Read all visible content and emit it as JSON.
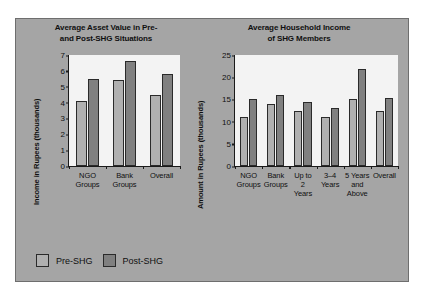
{
  "legend": {
    "items": [
      {
        "label": "Pre-SHG",
        "key": "pre",
        "color": "#b0b0b0"
      },
      {
        "label": "Post-SHG",
        "key": "post",
        "color": "#808080"
      }
    ]
  },
  "chart_data": [
    {
      "id": "asset-value",
      "type": "bar",
      "title": "Average Asset Value in Pre- and Post-SHG Situations",
      "title_line1": "Average Asset Value in Pre-",
      "title_line2": "and Post-SHG Situations",
      "xlabel": "",
      "ylabel": "Income in Rupees (thousands)",
      "ylim": [
        0,
        7
      ],
      "yticks": [
        0,
        1,
        2,
        3,
        4,
        5,
        6,
        7
      ],
      "grid": false,
      "legend_position": "bottom-left",
      "categories": [
        "NGO Groups",
        "Bank Groups",
        "Overall"
      ],
      "category_lines": [
        [
          "NGO",
          "Groups"
        ],
        [
          "Bank",
          "Groups"
        ],
        [
          "Overall"
        ]
      ],
      "series": [
        {
          "name": "Pre-SHG",
          "values": [
            4.1,
            5.4,
            4.5
          ]
        },
        {
          "name": "Post-SHG",
          "values": [
            5.5,
            6.65,
            5.8
          ]
        }
      ]
    },
    {
      "id": "household-income",
      "type": "bar",
      "title": "Average Household Income of SHG Members",
      "title_line1": "Average Household Income",
      "title_line2": "of SHG Members",
      "xlabel": "",
      "ylabel": "Amount in Rupees (thousands)",
      "ylim": [
        0,
        25
      ],
      "yticks": [
        0,
        5,
        10,
        15,
        20,
        25
      ],
      "grid": false,
      "legend_position": "bottom-left",
      "categories": [
        "NGO Groups",
        "Bank Groups",
        "Up to 2 Years",
        "3–4 Years",
        "5 Years and Above",
        "Overall"
      ],
      "category_lines": [
        [
          "NGO",
          "Groups"
        ],
        [
          "Bank",
          "Groups"
        ],
        [
          "Up to",
          "2",
          "Years"
        ],
        [
          "3–4",
          "Years"
        ],
        [
          "5 Years",
          "and",
          "Above"
        ],
        [
          "Overall"
        ]
      ],
      "series": [
        {
          "name": "Pre-SHG",
          "values": [
            11.0,
            14.0,
            12.4,
            11.0,
            15.0,
            12.3
          ]
        },
        {
          "name": "Post-SHG",
          "values": [
            15.1,
            15.9,
            14.4,
            13.0,
            21.8,
            15.4
          ]
        }
      ]
    }
  ]
}
